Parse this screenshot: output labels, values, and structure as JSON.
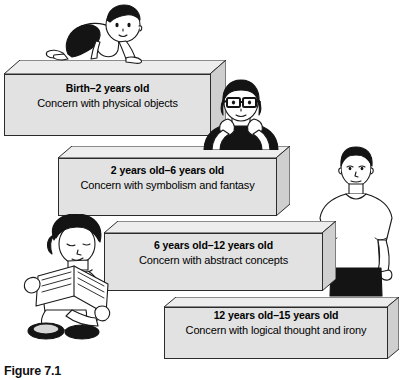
{
  "figure": {
    "caption": "Figure 7.1",
    "type": "developmental-stages-staircase-diagram",
    "colors": {
      "slab_face": "#e2e2e2",
      "slab_top": "#ededed",
      "slab_side": "#cfcfcf",
      "outline": "#2b2b2b",
      "text": "#000000",
      "background": "#ffffff"
    }
  },
  "steps": [
    {
      "age": "Birth–2 years old",
      "description": "Concern with physical objects",
      "figure_label": "crawling-baby"
    },
    {
      "age": "2 years old–6 years old",
      "description": "Concern with symbolism and fantasy",
      "figure_label": "child-with-glasses-resting-chin-on-hands"
    },
    {
      "age": "6 years old–12 years old",
      "description": "Concern with abstract concepts",
      "figure_label": "seated-child-reading-book"
    },
    {
      "age": "12 years old–15 years old",
      "description": "Concern with logical thought and irony",
      "figure_label": "standing-teenager"
    }
  ]
}
